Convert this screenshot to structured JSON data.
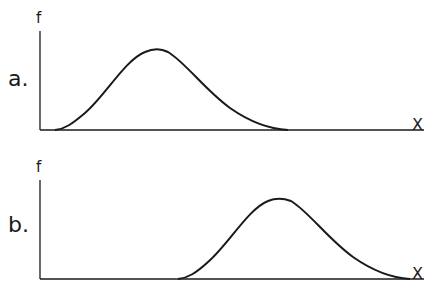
{
  "panels": [
    {
      "label": "a.",
      "y_axis_label": "f",
      "x_axis_label": "X",
      "curve": "right-skewed bell curve, peak near left-center",
      "peak_position": "left"
    },
    {
      "label": "b.",
      "y_axis_label": "f",
      "x_axis_label": "X",
      "curve": "right-skewed bell curve, peak near right-center",
      "peak_position": "right"
    }
  ],
  "colors": {
    "stroke": "#1a1a1a",
    "background": "#ffffff"
  }
}
